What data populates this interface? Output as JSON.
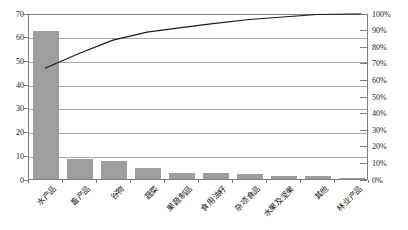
{
  "chart_data": {
    "type": "bar",
    "subtype": "pareto-combo",
    "title": "",
    "xlabel": "",
    "ylabel": "",
    "legend": false,
    "grid": true,
    "categories": [
      "水产品",
      "畜产品",
      "谷物",
      "蔬菜",
      "果蔬制品",
      "食用油籽",
      "杂项食品",
      "水果及坚果",
      "其他",
      "林业产品"
    ],
    "series": [
      {
        "name": "category-values-bars",
        "kind": "bar",
        "axis": "left",
        "values": [
          62.5,
          8.3,
          7.5,
          4.5,
          2.5,
          2.4,
          2.1,
          1.4,
          1.4,
          0.3
        ],
        "color": "#9e9e9e"
      },
      {
        "name": "cumulative-percentage-line",
        "kind": "line",
        "axis": "right",
        "values": [
          67.3,
          76.2,
          84.3,
          89.1,
          91.8,
          94.4,
          96.7,
          98.2,
          99.7,
          100.0
        ],
        "color": "#1a1a1a"
      }
    ],
    "left_axis": {
      "min": 0,
      "max": 70,
      "tick_step": 10,
      "tick_labels": [
        "0",
        "10",
        "20",
        "30",
        "40",
        "50",
        "60",
        "70"
      ]
    },
    "right_axis": {
      "min": 0,
      "max": 100,
      "tick_step": 10,
      "tick_labels": [
        "0%",
        "10%",
        "20%",
        "30%",
        "40%",
        "50%",
        "60%",
        "70%",
        "80%",
        "90%",
        "100%"
      ]
    },
    "colors": {
      "bar": "#9e9e9e",
      "line": "#1a1a1a",
      "grid": "#a8a8a8",
      "border": "#7f7f7f",
      "background": "#ffffff"
    }
  }
}
